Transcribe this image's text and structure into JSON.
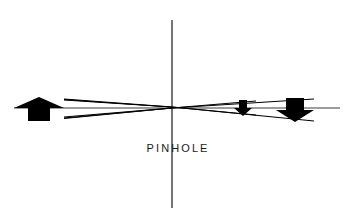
{
  "figure": {
    "kind": "optics-ray-diagram",
    "title_caption": "PINHOLE",
    "background_color": "#ffffff",
    "ink_color": "#000000",
    "axis_color": "#3b3b3b",
    "width": 354,
    "height": 222
  },
  "labels": {
    "pinhole_label": "PINHOLE"
  },
  "geometry": {
    "pinhole_x": 172,
    "pinhole_y": 107,
    "screen_line": {
      "x": 172,
      "y_top": 20,
      "y_bottom": 208,
      "stroke_width": 1.4
    },
    "optical_axis": {
      "x_start": 14,
      "x_end": 340,
      "y": 108,
      "stroke_width": 1.1
    },
    "object_arrow": {
      "name": "upward-arrow-object",
      "direction": "up",
      "x_center": 39,
      "tip_y": 97,
      "base_y": 121,
      "head_half_width": 25,
      "shaft_half_width": 11,
      "head_bottom_y": 108
    },
    "image_arrow_large": {
      "name": "downward-arrow-image-large",
      "direction": "down",
      "x_center": 295,
      "tip_y": 122,
      "top_y": 98,
      "head_half_width": 19,
      "shaft_half_width": 9,
      "head_top_y": 110
    },
    "image_arrow_small": {
      "name": "downward-arrow-image-small",
      "direction": "down",
      "x_center": 243,
      "tip_y": 116,
      "top_y": 100,
      "head_half_width": 9,
      "shaft_half_width": 4,
      "head_top_y": 108
    },
    "ray_bundles": [
      {
        "name": "ray-object-top-to-large-image-tip",
        "points": "64,99 172,107 314,121"
      },
      {
        "name": "ray-object-bottom-to-large-image-top",
        "points": "64,118 172,108 314,99"
      },
      {
        "name": "ray-object-top-to-small-image-tip",
        "points": "64,100 172,107 256,115"
      },
      {
        "name": "ray-object-bottom-to-small-image-top",
        "points": "64,117 172,108 256,101"
      }
    ]
  },
  "caption": {
    "text": "PINHOLE",
    "x_center": 172,
    "y": 148
  }
}
